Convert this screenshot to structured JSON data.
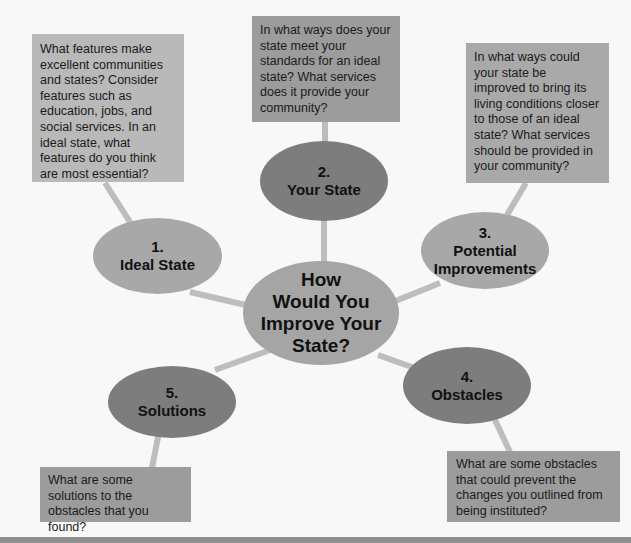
{
  "diagram": {
    "center": {
      "lines": [
        "How",
        "Would You",
        "Improve Your",
        "State?"
      ]
    },
    "nodes": [
      {
        "number": "1.",
        "title": "Ideal State",
        "prompt": "What features make excellent communities and states? Consider features such as education, jobs, and social services. In an ideal state, what features do you think are most essential?"
      },
      {
        "number": "2.",
        "title": "Your State",
        "prompt": "In what ways does your state meet your standards for an ideal state? What services does it provide your community?"
      },
      {
        "number": "3.",
        "title_lines": [
          "Potential",
          "Improvements"
        ],
        "prompt": "In what ways could your state be improved to bring its living conditions closer to those of an ideal state? What services should be provided in your community?"
      },
      {
        "number": "4.",
        "title": "Obstacles",
        "prompt": "What are some obstacles that could prevent the changes you outlined from being instituted?"
      },
      {
        "number": "5.",
        "title": "Solutions",
        "prompt": "What are some solutions to the obstacles that you found?"
      }
    ]
  },
  "colors": {
    "background": "#f8f8f8",
    "connector": "#bdbdbd",
    "light_oval": "#a8a8a8",
    "dark_oval": "#7d7d7d",
    "box_light": "#b9b9b9",
    "box_dark": "#9c9c9c"
  }
}
